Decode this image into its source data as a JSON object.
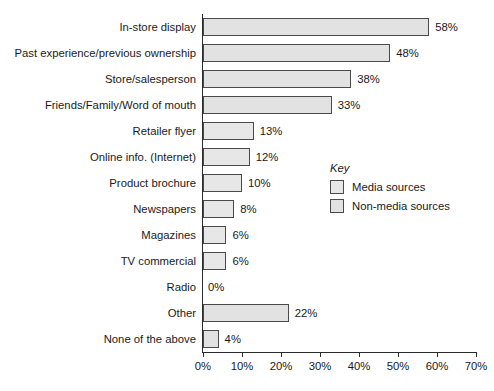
{
  "chart_data": {
    "type": "bar",
    "orientation": "horizontal",
    "title": "",
    "xlabel": "",
    "ylabel": "",
    "xlim": [
      0,
      70
    ],
    "grid": false,
    "categories": [
      "In-store display",
      "Past experience/previous ownership",
      "Store/salesperson",
      "Friends/Family/Word of mouth",
      "Retailer flyer",
      "Online info. (Internet)",
      "Product brochure",
      "Newspapers",
      "Magazines",
      "TV commercial",
      "Radio",
      "Other",
      "None of the above"
    ],
    "values": [
      58,
      48,
      38,
      33,
      13,
      12,
      10,
      8,
      6,
      6,
      0,
      22,
      4
    ],
    "value_labels": [
      "58%",
      "48%",
      "38%",
      "33%",
      "13%",
      "12%",
      "10%",
      "8%",
      "6%",
      "6%",
      "0%",
      "22%",
      "4%"
    ],
    "series_of_bar": [
      "non-media",
      "non-media",
      "non-media",
      "non-media",
      "media",
      "media",
      "media",
      "media",
      "media",
      "media",
      "media",
      "non-media",
      "non-media"
    ],
    "xticks": [
      0,
      10,
      20,
      30,
      40,
      50,
      60,
      70
    ],
    "xtick_labels": [
      "0%",
      "10%",
      "20%",
      "30%",
      "40%",
      "50%",
      "60%",
      "70%"
    ],
    "legend": {
      "position": "inside-right",
      "title": "Key",
      "entries": [
        {
          "label": "Media sources",
          "key": "media",
          "color": "#e7e7e7"
        },
        {
          "label": "Non-media sources",
          "key": "non-media",
          "color": "#e2e2e2"
        }
      ]
    },
    "colors": {
      "bar_fill_media": "#e7e7e7",
      "bar_fill_non_media": "#e2e2e2",
      "bar_border": "#4a4a4a",
      "axis": "#2b2b2b",
      "text": "#1a1a1a",
      "background": "#ffffff"
    }
  }
}
